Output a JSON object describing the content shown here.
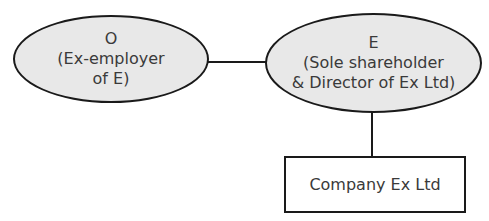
{
  "diagram": {
    "nodes": [
      {
        "id": "O",
        "shape": "ellipse",
        "lines": [
          "O",
          "(Ex-employer",
          "of E)"
        ]
      },
      {
        "id": "E",
        "shape": "ellipse",
        "lines": [
          "E",
          "(Sole shareholder",
          "& Director of Ex Ltd)"
        ]
      },
      {
        "id": "ExLtd",
        "shape": "rectangle",
        "label": "Company Ex Ltd"
      }
    ],
    "edges": [
      {
        "from": "O",
        "to": "E"
      },
      {
        "from": "E",
        "to": "ExLtd"
      }
    ],
    "colors": {
      "ellipse_fill": "#e8e8e8",
      "stroke": "#1a1a1a",
      "text": "#3a3a3a"
    }
  }
}
